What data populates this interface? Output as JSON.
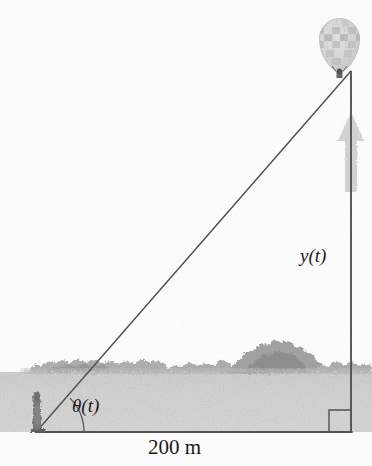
{
  "labels": {
    "angle": "θ(t)",
    "height": "y(t)",
    "base_distance": "200 m"
  },
  "icons": {
    "balloon": "hot-air-balloon-icon",
    "observer": "observer-person-icon",
    "rise_arrow": "up-arrow-icon",
    "right_angle": "right-angle-marker-icon",
    "treeline": "treeline-icon"
  },
  "colors": {
    "sky": "#ffffff",
    "ground": "#d8d8d8",
    "treeline": "#8a8a8a",
    "line": "#262626",
    "arrow": "#a8a8a8",
    "balloon_light": "#e8e8e8",
    "balloon_dark": "#9a9a9a",
    "text": "#1a1a1a"
  },
  "geometry": {
    "observer_point": [
      36,
      432
    ],
    "base_point": [
      351,
      432
    ],
    "balloon_anchor": [
      351,
      72
    ],
    "base_length_m": 200,
    "horizon_y": 372
  }
}
